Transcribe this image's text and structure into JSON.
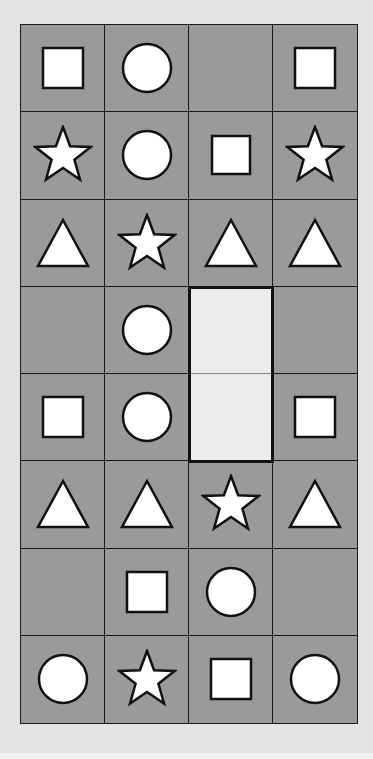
{
  "puzzle": {
    "rows": 8,
    "cols": 4,
    "cells": [
      [
        "square",
        "circle",
        "",
        "square"
      ],
      [
        "star",
        "circle",
        "square-small",
        "star"
      ],
      [
        "triangle",
        "star",
        "triangle",
        "triangle"
      ],
      [
        "",
        "circle",
        "answer",
        ""
      ],
      [
        "square",
        "circle",
        "answer",
        "square"
      ],
      [
        "triangle",
        "triangle",
        "star",
        "triangle"
      ],
      [
        "",
        "square",
        "circle",
        ""
      ],
      [
        "circle",
        "star",
        "square",
        "circle"
      ]
    ],
    "answer_region": {
      "col": 2,
      "row_start": 3,
      "row_end": 4
    }
  },
  "colors": {
    "page_bg": "#e4e4e4",
    "cell_bg": "#9a9a9a",
    "answer_bg": "#ececec",
    "grid_line": "#1a1a1a",
    "shape_fill": "#ffffff",
    "shape_stroke": "#111111"
  }
}
